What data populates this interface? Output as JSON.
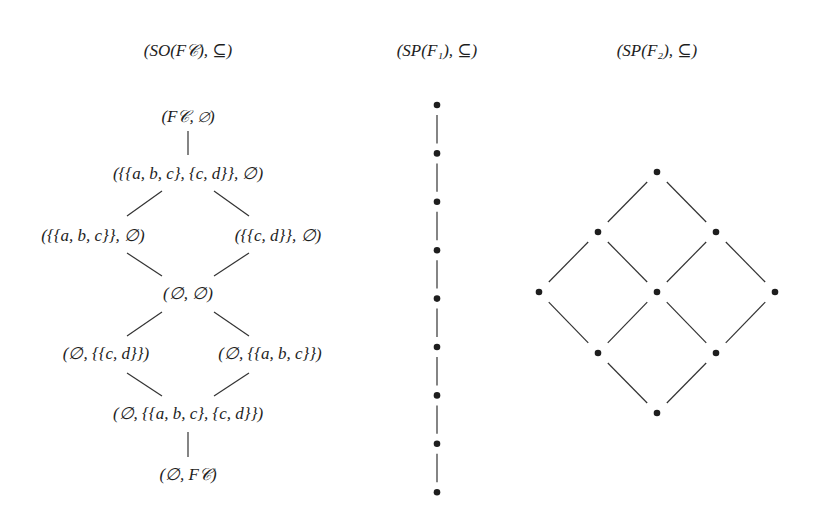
{
  "titles": {
    "left": "(SO(F𝒞), ⊆)",
    "middle": "(SP(F₁), ⊆)",
    "right": "(SP(F₂), ⊆)"
  },
  "left_lattice": {
    "nodes": [
      {
        "id": "top",
        "label": "(F𝒞, ∅)"
      },
      {
        "id": "abc_cd",
        "label": "({{a, b, c}, {c, d}}, ∅)"
      },
      {
        "id": "abc",
        "label": "({{a, b, c}}, ∅)"
      },
      {
        "id": "cd",
        "label": "({{c, d}}, ∅)"
      },
      {
        "id": "empty",
        "label": "(∅, ∅)"
      },
      {
        "id": "e_cd",
        "label": "(∅, {{c, d}})"
      },
      {
        "id": "e_abc",
        "label": "(∅, {{a, b, c}})"
      },
      {
        "id": "e_abc_cd",
        "label": "(∅, {{a, b, c}, {c, d}})"
      },
      {
        "id": "bottom",
        "label": "(∅, F𝒞)"
      }
    ],
    "edges": [
      [
        "top",
        "abc_cd"
      ],
      [
        "abc_cd",
        "abc"
      ],
      [
        "abc_cd",
        "cd"
      ],
      [
        "abc",
        "empty"
      ],
      [
        "cd",
        "empty"
      ],
      [
        "empty",
        "e_cd"
      ],
      [
        "empty",
        "e_abc"
      ],
      [
        "e_cd",
        "e_abc_cd"
      ],
      [
        "e_abc",
        "e_abc_cd"
      ],
      [
        "e_abc_cd",
        "bottom"
      ]
    ]
  },
  "middle_chain": {
    "node_count": 9
  },
  "right_lattice": {
    "nodes": [
      "t",
      "l1",
      "r1",
      "l2",
      "m2",
      "r2",
      "l3",
      "r3",
      "b"
    ],
    "edges": [
      [
        "t",
        "l1"
      ],
      [
        "t",
        "r1"
      ],
      [
        "l1",
        "l2"
      ],
      [
        "l1",
        "m2"
      ],
      [
        "r1",
        "m2"
      ],
      [
        "r1",
        "r2"
      ],
      [
        "l2",
        "l3"
      ],
      [
        "m2",
        "l3"
      ],
      [
        "m2",
        "r3"
      ],
      [
        "r2",
        "r3"
      ],
      [
        "l3",
        "b"
      ],
      [
        "r3",
        "b"
      ]
    ]
  },
  "colors": {
    "ink": "#1e1e1e",
    "line": "#333333"
  }
}
